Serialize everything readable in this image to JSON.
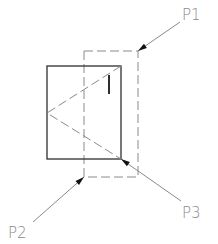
{
  "diagram": {
    "width": 218,
    "height": 244,
    "colors": {
      "solid": "#2e2e2e",
      "dashed": "#8a8a8a",
      "leader": "#8a8a8a",
      "text": "#8a8a8a",
      "background": "#ffffff"
    },
    "solid_rect": {
      "x": 47,
      "y": 66,
      "w": 74,
      "h": 93
    },
    "dashed_rect": {
      "x": 84,
      "y": 51,
      "w": 54,
      "h": 126
    },
    "dashed_triangle": [
      [
        121,
        66
      ],
      [
        47,
        113
      ],
      [
        121,
        159
      ]
    ],
    "vertical_mark": {
      "x": 109,
      "y1": 75,
      "y2": 94
    },
    "points": [
      {
        "label": "P1",
        "text_x": 182,
        "text_y": 20,
        "leader_from": [
          180,
          22
        ],
        "tip": [
          138,
          51
        ]
      },
      {
        "label": "P2",
        "text_x": 8,
        "text_y": 238,
        "leader_from": [
          33,
          222
        ],
        "tip": [
          84,
          177
        ]
      },
      {
        "label": "P3",
        "text_x": 182,
        "text_y": 218,
        "leader_from": [
          181,
          201
        ],
        "tip": [
          121,
          159
        ]
      }
    ]
  }
}
